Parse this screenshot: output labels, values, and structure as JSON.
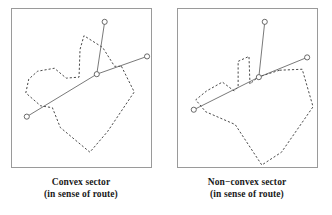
{
  "figure": {
    "background_color": "#ffffff",
    "panel_border_color": "#9a9a9a",
    "route_color": "#555555",
    "boundary_color": "#333333",
    "node_fill": "#ffffff"
  },
  "panels": [
    {
      "id": "convex",
      "caption_line1": "Convex sector",
      "caption_line2": "(in sense of route)",
      "nodes": [
        {
          "name": "top-node",
          "cx": 94,
          "cy": 13
        },
        {
          "name": "center-node",
          "cx": 86,
          "cy": 66
        },
        {
          "name": "right-node",
          "cx": 137,
          "cy": 48
        },
        {
          "name": "left-node",
          "cx": 15,
          "cy": 109
        }
      ],
      "route_segments": [
        {
          "name": "route-top-branch",
          "points": "94,13 86,66"
        },
        {
          "name": "route-main-branch",
          "points": "15,109 86,66 137,48"
        }
      ],
      "boundary_points": "111,58 124,84 97,124 79,145 49,120 41,100 29,98 14,85 17,71 26,63 43,60 55,70 68,69 69,41 73,27 92,39 104,58",
      "boundary_closed": true
    },
    {
      "id": "non-convex",
      "caption_line1": "Non−convex sector",
      "caption_line2": "(in sense of route)",
      "nodes": [
        {
          "name": "top-node",
          "cx": 88,
          "cy": 13
        },
        {
          "name": "center-node",
          "cx": 82,
          "cy": 69
        },
        {
          "name": "right-node",
          "cx": 131,
          "cy": 49
        },
        {
          "name": "left-node",
          "cx": 16,
          "cy": 102
        }
      ],
      "route_segments": [
        {
          "name": "route-top-branch",
          "points": "88,13 82,69"
        },
        {
          "name": "route-main-branch",
          "points": "16,102 82,69 131,49"
        }
      ],
      "boundary_points": "103,62 126,61 137,99 105,145 85,158 58,117 28,104 18,92 29,83 45,74 57,83 61,79 61,53 72,48 73,76 81,69",
      "boundary_closed": true
    }
  ]
}
